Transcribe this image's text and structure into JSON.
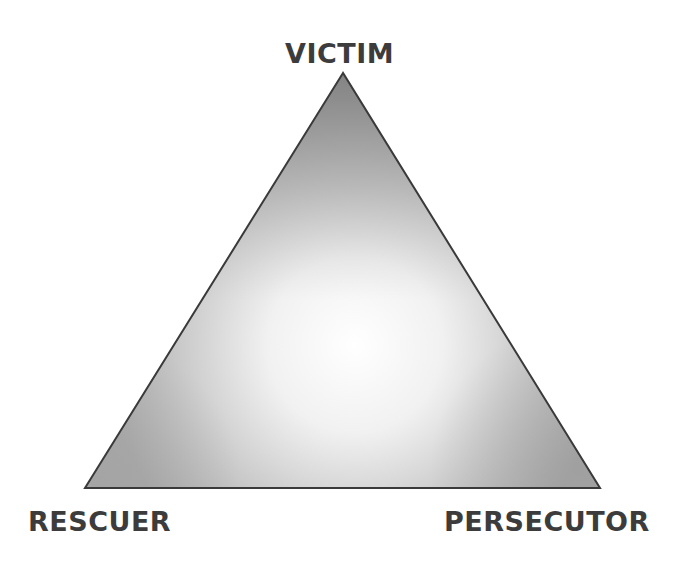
{
  "diagram": {
    "vertices": {
      "top": {
        "label": "VICTIM",
        "x": 343,
        "y": 73
      },
      "bottom_left": {
        "label": "RESCUER",
        "x": 85,
        "y": 488
      },
      "bottom_right": {
        "label": "PERSECUTOR",
        "x": 600,
        "y": 488
      }
    },
    "colors": {
      "background": "#ffffff",
      "label_text": "#3c3c3c",
      "outline": "#3a3a3a",
      "fill_dark": "#8e8e8e",
      "fill_light": "#ffffff"
    }
  }
}
